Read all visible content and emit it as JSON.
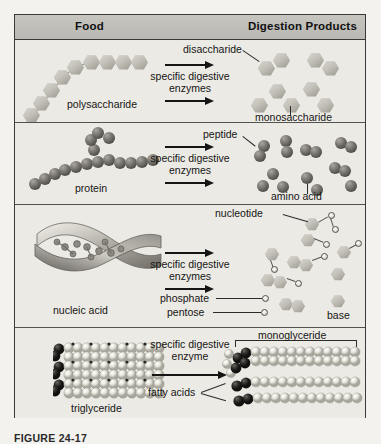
{
  "figure": {
    "header": {
      "food_label": "Food",
      "products_label": "Digestion Products"
    },
    "rows": [
      {
        "id": "carbohydrate",
        "food_label": "polysaccharide",
        "process_text": "specific digestive\nenzymes",
        "product_labels": [
          "disaccharide",
          "monosaccharide"
        ],
        "arrow_count": 2
      },
      {
        "id": "protein",
        "food_label": "protein",
        "process_text": "specific digestive\nenzymes",
        "product_labels": [
          "peptide",
          "amino acid"
        ],
        "arrow_count": 2
      },
      {
        "id": "nucleic-acid",
        "food_label": "nucleic acid",
        "process_text": "specific digestive\nenzymes",
        "product_labels": [
          "nucleotide",
          "phosphate",
          "pentose",
          "base"
        ],
        "arrow_count": 2
      },
      {
        "id": "lipid",
        "food_label": "triglyceride",
        "process_text": "specific digestive\nenzyme",
        "product_labels": [
          "monoglyceride",
          "fatty acids"
        ],
        "arrow_count": 1
      }
    ]
  },
  "caption": {
    "text": "FIGURE 24-17"
  },
  "colors": {
    "page_background": "#f3f2ee",
    "panel_background": "#eceae4",
    "header_band": "#bfbeb9",
    "border": "#3a3a3a",
    "text": "#151515",
    "hexagon": "#c2c0b7",
    "sphere_dark": "#55534d",
    "sphere_light": "#eceae2"
  }
}
